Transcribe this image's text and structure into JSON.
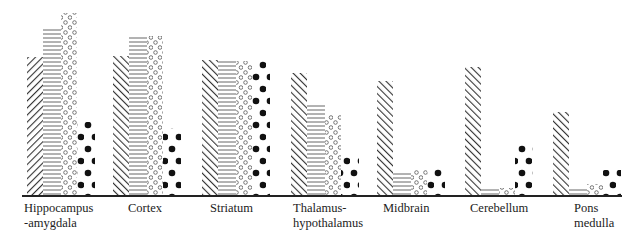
{
  "chart_data": {
    "type": "bar",
    "title": "",
    "xlabel": "",
    "ylabel": "",
    "grid": false,
    "legend": null,
    "axis_note": "No y-axis shown; values are relative bar heights (pixel units above baseline).",
    "categories": [
      "Hippocampus -amygdala",
      "Cortex",
      "Striatum",
      "Thalamus- hypothalamus",
      "Midbrain",
      "Cerebellum",
      "Pons medulla"
    ],
    "category_labels": [
      [
        "Hippocampus",
        "-amygdala"
      ],
      [
        "Cortex"
      ],
      [
        "Striatum"
      ],
      [
        "Thalamus-",
        "hypothalamus"
      ],
      [
        "Midbrain"
      ],
      [
        "Cerebellum"
      ],
      [
        "Pons",
        "medulla"
      ]
    ],
    "series": [
      {
        "name": "Series 1 (diagonal hatch)",
        "pattern": "diagonal",
        "values": [
          139,
          140,
          136,
          123,
          115,
          129,
          84
        ]
      },
      {
        "name": "Series 2 (horizontal lines)",
        "pattern": "horizontal",
        "values": [
          169,
          160,
          136,
          93,
          24,
          8,
          8
        ]
      },
      {
        "name": "Series 3 (open circles)",
        "pattern": "open-circles",
        "values": [
          183,
          160,
          135,
          81,
          26,
          8,
          12
        ]
      },
      {
        "name": "Series 4 (solid dots)",
        "pattern": "solid-dots",
        "values": [
          74,
          68,
          135,
          41,
          28,
          54,
          26
        ]
      }
    ],
    "ylim": [
      0,
      190
    ]
  },
  "layout": {
    "baseline_y": 196,
    "group_left_x": [
      27,
      113,
      202,
      291,
      377,
      465,
      553
    ],
    "bar_widths": [
      16,
      18,
      16,
      18
    ],
    "label_x": [
      24,
      128,
      210,
      293,
      383,
      470,
      574
    ],
    "colors": {
      "ink": "#222222",
      "background": "#ffffff"
    }
  }
}
